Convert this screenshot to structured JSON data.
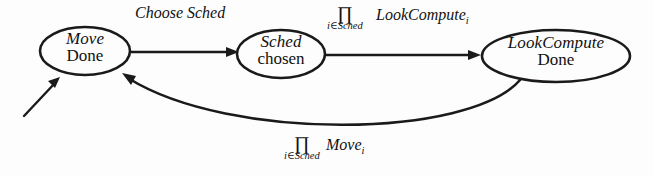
{
  "diagram": {
    "background_color": "#fdfdfd",
    "stroke_color": "#1a1a1a",
    "nodes": [
      {
        "id": "move-done",
        "line1": "Move",
        "line2": "Done",
        "cx": 85,
        "cy": 51,
        "rx": 45,
        "ry": 24
      },
      {
        "id": "sched-chosen",
        "line1": "Sched",
        "line2": "chosen",
        "cx": 281,
        "cy": 54,
        "rx": 44,
        "ry": 24
      },
      {
        "id": "lookcompute-done",
        "line1": "LookCompute",
        "line2": "Done",
        "cx": 556,
        "cy": 56,
        "rx": 74,
        "ry": 26
      }
    ],
    "edges": [
      {
        "id": "start-arrow",
        "from": "initial",
        "to": "move-done",
        "label": ""
      },
      {
        "id": "move-to-sched",
        "from": "move-done",
        "to": "sched-chosen",
        "label": "Choose Sched"
      },
      {
        "id": "sched-to-lookcompute",
        "from": "sched-chosen",
        "to": "lookcompute-done",
        "operator": "∏",
        "subscript": "i∈Sched",
        "term": "LookCompute",
        "term_index": "i"
      },
      {
        "id": "lookcompute-to-move",
        "from": "lookcompute-done",
        "to": "move-done",
        "operator": "∏",
        "subscript": "i∈Sched",
        "term": "Move",
        "term_index": "i"
      }
    ]
  }
}
